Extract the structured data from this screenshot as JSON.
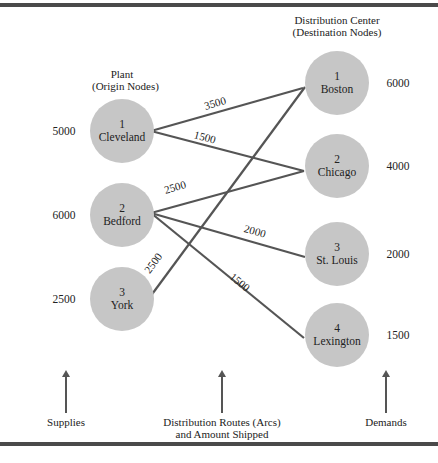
{
  "headings": {
    "origin": [
      "Plant",
      "(Origin Nodes)"
    ],
    "destination": [
      "Distribution Center",
      "(Destination Nodes)"
    ]
  },
  "origins": [
    {
      "id": "1",
      "name": "Cleveland",
      "supply": "5000",
      "cx": 122,
      "cy": 131
    },
    {
      "id": "2",
      "name": "Bedford",
      "supply": "6000",
      "cx": 122,
      "cy": 215
    },
    {
      "id": "3",
      "name": "York",
      "supply": "2500",
      "cx": 122,
      "cy": 299
    }
  ],
  "destinations": [
    {
      "id": "1",
      "name": "Boston",
      "demand": "6000",
      "cx": 337,
      "cy": 83
    },
    {
      "id": "2",
      "name": "Chicago",
      "demand": "4000",
      "cx": 337,
      "cy": 166
    },
    {
      "id": "3",
      "name": "St. Louis",
      "demand": "2000",
      "cx": 337,
      "cy": 254
    },
    {
      "id": "4",
      "name": "Lexington",
      "demand": "1500",
      "cx": 337,
      "cy": 335
    }
  ],
  "arcs": [
    {
      "from": "Cleveland",
      "to": "Boston",
      "amount": "3500",
      "x1": 151,
      "y1": 131,
      "x2": 303,
      "y2": 88
    },
    {
      "from": "Cleveland",
      "to": "Chicago",
      "amount": "1500",
      "x1": 151,
      "y1": 131,
      "x2": 304,
      "y2": 171
    },
    {
      "from": "Bedford",
      "to": "Chicago",
      "amount": "2500",
      "x1": 151,
      "y1": 213,
      "x2": 304,
      "y2": 171
    },
    {
      "from": "Bedford",
      "to": "St. Louis",
      "amount": "2000",
      "x1": 151,
      "y1": 213,
      "x2": 305,
      "y2": 257
    },
    {
      "from": "Bedford",
      "to": "Lexington",
      "amount": "1500",
      "x1": 151,
      "y1": 213,
      "x2": 304,
      "y2": 338
    },
    {
      "from": "York",
      "to": "Boston",
      "amount": "2500",
      "x1": 150,
      "y1": 297,
      "x2": 305,
      "y2": 87
    }
  ],
  "arc_labels": [
    {
      "text": "3500",
      "x": 215,
      "y": 103,
      "angle": -16
    },
    {
      "text": "1500",
      "x": 205,
      "y": 137,
      "angle": 15
    },
    {
      "text": "2500",
      "x": 175,
      "y": 187,
      "angle": -16
    },
    {
      "text": "2000",
      "x": 255,
      "y": 231,
      "angle": 16
    },
    {
      "text": "1500",
      "x": 240,
      "y": 282,
      "angle": 40
    },
    {
      "text": "2500",
      "x": 153,
      "y": 263,
      "angle": -54
    }
  ],
  "footer": {
    "supplies": "Supplies",
    "routes": [
      "Distribution Routes (Arcs)",
      "and Amount Shipped"
    ],
    "demands": "Demands"
  },
  "colors": {
    "node_fill": "#c6c6c6",
    "arc_stroke": "#555555",
    "rule": "#4a4a4a"
  }
}
